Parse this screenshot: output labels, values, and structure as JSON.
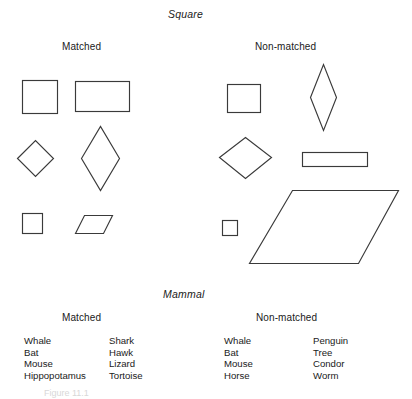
{
  "figure": {
    "caption": "Figure 11.1"
  },
  "sections": [
    {
      "id": "square",
      "title": "Square",
      "columns": [
        {
          "id": "matched",
          "header": "Matched"
        },
        {
          "id": "non-matched",
          "header": "Non-matched"
        }
      ]
    },
    {
      "id": "mammal",
      "title": "Mammal",
      "columns": [
        {
          "id": "matched",
          "header": "Matched"
        },
        {
          "id": "non-matched",
          "header": "Non-matched"
        }
      ]
    }
  ],
  "square_section": {
    "title": "Square",
    "matched": {
      "header": "Matched",
      "shapes": [
        {
          "name": "square",
          "label": "square"
        },
        {
          "name": "rectangle",
          "label": "rectangle"
        },
        {
          "name": "diamond",
          "label": "diamond"
        },
        {
          "name": "tall-rhombus",
          "label": "tall rhombus"
        },
        {
          "name": "small-square",
          "label": "small square"
        },
        {
          "name": "small-parallelogram",
          "label": "small parallelogram"
        }
      ]
    },
    "non_matched": {
      "header": "Non-matched",
      "shapes": [
        {
          "name": "square",
          "label": "square"
        },
        {
          "name": "narrow-tall-diamond",
          "label": "narrow tall diamond"
        },
        {
          "name": "diamond",
          "label": "diamond"
        },
        {
          "name": "thin-wide-rectangle",
          "label": "thin wide rectangle"
        },
        {
          "name": "small-square",
          "label": "small square"
        },
        {
          "name": "large-parallelogram",
          "label": "large parallelogram"
        }
      ]
    }
  },
  "mammal_section": {
    "title": "Mammal",
    "matched": {
      "header": "Matched",
      "column_a": [
        "Whale",
        "Bat",
        "Mouse",
        "Hippopotamus"
      ],
      "column_b": [
        "Shark",
        "Hawk",
        "Lizard",
        "Tortoise"
      ]
    },
    "non_matched": {
      "header": "Non-matched",
      "column_a": [
        "Whale",
        "Bat",
        "Mouse",
        "Horse"
      ],
      "column_b": [
        "Penguin",
        "Tree",
        "Condor",
        "Worm"
      ]
    }
  },
  "colors": {
    "background": "#ffffff",
    "text": "#1a1a1a",
    "stroke": "#3a3a3a",
    "caption": "#d8d8d8"
  }
}
